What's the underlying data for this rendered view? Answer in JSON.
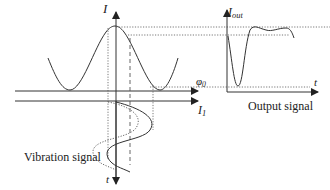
{
  "labels": {
    "input_axis_y": "I",
    "input_axis_x": "I",
    "input_axis_x_sub": "1",
    "time_axis_down": "t",
    "output_axis_y": "I",
    "output_axis_y_sub": "out",
    "output_axis_x": "t",
    "phase": "φ",
    "phase_sub": "0",
    "vibration_caption": "Vibration signal",
    "output_caption": "Output signal"
  },
  "colors": {
    "stroke": "#333333",
    "dotted": "#555555",
    "text": "#222222"
  }
}
